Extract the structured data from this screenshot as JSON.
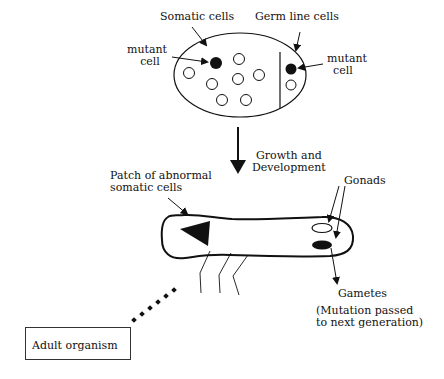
{
  "labels": {
    "somatic_cells": "Somatic cells",
    "germ_line_cells": "Germ line cells",
    "mutant_cell_left": [
      "mutant",
      "cell"
    ],
    "mutant_cell_right": [
      "mutant",
      "cell"
    ],
    "growth": [
      "Growth and",
      "Development"
    ],
    "patch": [
      "Patch of abnormal",
      "somatic cells"
    ],
    "gonads": "Gonads",
    "gametes": "Gametes",
    "mutation_note": [
      "(Mutation passed",
      "to next generation)"
    ],
    "adult_organism": "Adult organism"
  },
  "colors": {
    "ink": "#111111",
    "background": "#ffffff"
  }
}
